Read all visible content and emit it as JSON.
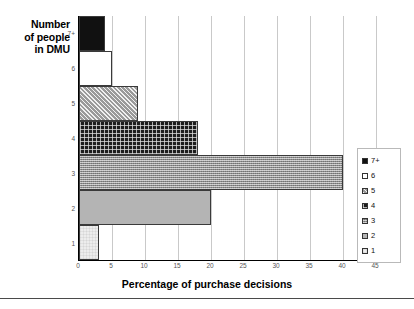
{
  "chart_data": {
    "type": "bar",
    "orientation": "horizontal",
    "title": "",
    "xlabel": "Percentage of purchase decisions",
    "ylabel": "Number of people in DMU",
    "ylabel_lines": [
      "Number",
      "of people",
      "in DMU"
    ],
    "categories": [
      "7+",
      "6",
      "5",
      "4",
      "3",
      "2",
      "1"
    ],
    "values": [
      4,
      5,
      9,
      18,
      40,
      20,
      3
    ],
    "xlim": [
      0,
      45
    ],
    "xticks": [
      0,
      5,
      10,
      15,
      20,
      25,
      30,
      35,
      40,
      45
    ],
    "xtick_labels": [
      "0",
      "5",
      "10",
      "15",
      "20",
      "25",
      "30",
      "35",
      "40",
      "45"
    ],
    "grid": true,
    "grid_axis": "x",
    "legend_position": "right",
    "legend": [
      {
        "label": "7+",
        "pattern": "solid-black",
        "color": "#111111"
      },
      {
        "label": "6",
        "pattern": "solid-white",
        "color": "#ffffff"
      },
      {
        "label": "5",
        "pattern": "diagonal-hatch",
        "color": "#9a9a9a"
      },
      {
        "label": "4",
        "pattern": "dark-grid",
        "color": "#1d1d1d"
      },
      {
        "label": "3",
        "pattern": "fine-texture",
        "color": "#8c8c8c"
      },
      {
        "label": "2",
        "pattern": "solid-gray",
        "color": "#b4b4b4"
      },
      {
        "label": "1",
        "pattern": "light-dotted",
        "color": "#ededed"
      }
    ],
    "series": [
      {
        "name": "7+",
        "value": 4
      },
      {
        "name": "6",
        "value": 5
      },
      {
        "name": "5",
        "value": 9
      },
      {
        "name": "4",
        "value": 18
      },
      {
        "name": "3",
        "value": 40
      },
      {
        "name": "2",
        "value": 20
      },
      {
        "name": "1",
        "value": 3
      }
    ]
  }
}
